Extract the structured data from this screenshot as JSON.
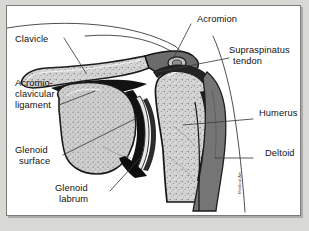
{
  "figure": {
    "kind": "anatomical-illustration",
    "signature": "Medical Art"
  },
  "panel": {
    "background": "#ffffff",
    "border_color": "#7b7b7b",
    "outer_background": "#d8d8d4"
  },
  "labels": [
    {
      "id": "clavicle",
      "text": "Clavicle",
      "side": "left"
    },
    {
      "id": "acromioclavicular-l1",
      "text": "Acromio-",
      "side": "left"
    },
    {
      "id": "acromioclavicular-l2",
      "text": "clavicular",
      "side": "left"
    },
    {
      "id": "acromioclavicular-l3",
      "text": "ligament",
      "side": "left"
    },
    {
      "id": "glenoid-surface-l1",
      "text": "Glenoid",
      "side": "left"
    },
    {
      "id": "glenoid-surface-l2",
      "text": "surface",
      "side": "left"
    },
    {
      "id": "glenoid-labrum-l1",
      "text": "Glenoid",
      "side": "left"
    },
    {
      "id": "glenoid-labrum-l2",
      "text": "labrum",
      "side": "left"
    },
    {
      "id": "acromion",
      "text": "Acromion",
      "side": "right"
    },
    {
      "id": "supraspinatus-l1",
      "text": "Supraspinatus",
      "side": "right"
    },
    {
      "id": "supraspinatus-l2",
      "text": "tendon",
      "side": "right"
    },
    {
      "id": "humerus",
      "text": "Humerus",
      "side": "right"
    },
    {
      "id": "deltoid",
      "text": "Deltoid",
      "side": "right"
    }
  ],
  "structures": [
    {
      "id": "clavicle-bone",
      "name": "Clavicle",
      "fill": "#c9c9c9",
      "texture": "trabecular"
    },
    {
      "id": "acromion-bone",
      "name": "Acromion",
      "fill": "#6e6e6e",
      "texture": "solid"
    },
    {
      "id": "scapula-glenoid",
      "name": "Scapula / glenoid",
      "fill": "#cacaca",
      "texture": "trabecular"
    },
    {
      "id": "humerus-head",
      "name": "Humeral head",
      "fill": "#d2d2d2",
      "texture": "trabecular"
    },
    {
      "id": "humerus-shaft",
      "name": "Humeral shaft",
      "fill": "#cfcfcf",
      "texture": "trabecular"
    },
    {
      "id": "deltoid-muscle",
      "name": "Deltoid muscle",
      "fill": "#737373",
      "texture": "solid"
    },
    {
      "id": "supraspinatus-band",
      "name": "Supraspinatus tendon",
      "fill": "#2a2a2a",
      "texture": "solid"
    },
    {
      "id": "joint-capsule",
      "name": "Joint capsule / labrum",
      "fill": "#111111",
      "texture": "solid"
    },
    {
      "id": "skin-contour",
      "name": "Skin contour",
      "fill": "none",
      "texture": "line"
    }
  ],
  "colors": {
    "ink": "#111111",
    "leader": "#404040",
    "bone_light": "#d2d2d2",
    "bone_mid": "#c0c0c0",
    "muscle_dark": "#737373",
    "capsule_black": "#151515"
  }
}
